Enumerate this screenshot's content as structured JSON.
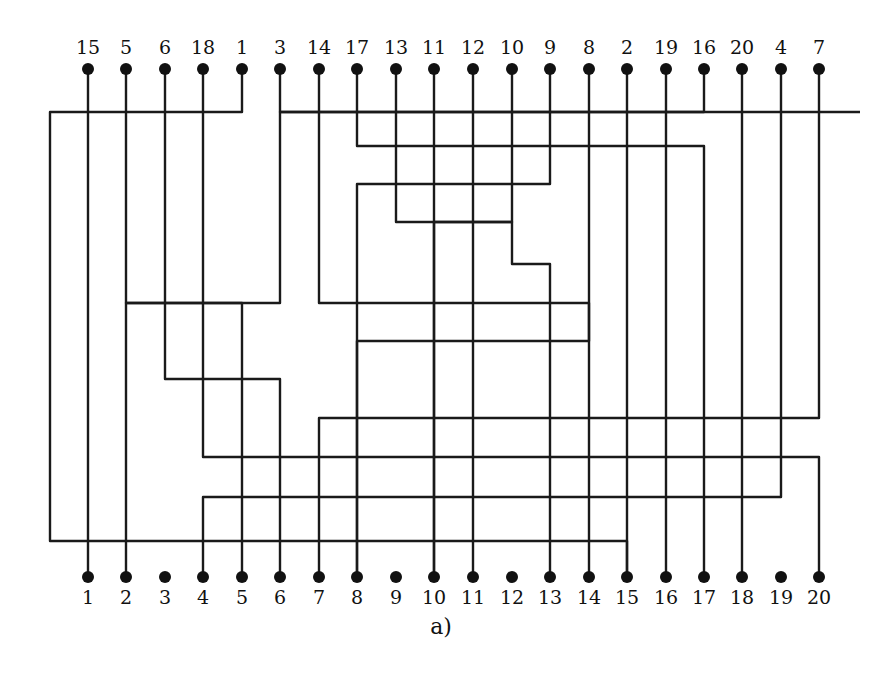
{
  "diagram": {
    "caption": "a)",
    "line_color": "#1a1a1a",
    "pin_color": "#111111",
    "columns_x": [
      88,
      126,
      165,
      203,
      242,
      280,
      319,
      357,
      396,
      434,
      473,
      512,
      550,
      589,
      627,
      666,
      704,
      742,
      781,
      819
    ],
    "top_pin_y": 69,
    "bottom_pin_y": 577,
    "top_labels": [
      "15",
      "5",
      "6",
      "18",
      "1",
      "3",
      "14",
      "17",
      "13",
      "11",
      "12",
      "10",
      "9",
      "8",
      "2",
      "19",
      "16",
      "20",
      "4",
      "7"
    ],
    "bottom_labels": [
      "1",
      "2",
      "3",
      "4",
      "5",
      "6",
      "7",
      "8",
      "9",
      "10",
      "11",
      "12",
      "13",
      "14",
      "15",
      "16",
      "17",
      "18",
      "19",
      "20"
    ],
    "wires": [
      {
        "label": "15",
        "path": [
          [
            88,
            69
          ],
          [
            88,
            541
          ],
          [
            627,
            541
          ],
          [
            627,
            577
          ]
        ]
      },
      {
        "label": "5",
        "path": [
          [
            126,
            69
          ],
          [
            126,
            303
          ],
          [
            242,
            303
          ],
          [
            242,
            577
          ]
        ]
      },
      {
        "label": "6",
        "path": [
          [
            165,
            69
          ],
          [
            165,
            379
          ],
          [
            280,
            379
          ],
          [
            280,
            577
          ]
        ]
      },
      {
        "label": "18",
        "path": [
          [
            203,
            69
          ],
          [
            203,
            457
          ],
          [
            742,
            457
          ],
          [
            742,
            577
          ]
        ]
      },
      {
        "label": "1",
        "path": [
          [
            242,
            69
          ],
          [
            242,
            112
          ],
          [
            50,
            112
          ],
          [
            50,
            541
          ],
          [
            88,
            541
          ],
          [
            88,
            577
          ]
        ]
      },
      {
        "label": "3",
        "path": [
          [
            280,
            69
          ],
          [
            280,
            112
          ],
          [
            860,
            112
          ],
          [
            860,
            112
          ]
        ],
        "alt": [
          [
            280,
            112
          ],
          [
            280,
            379
          ],
          [
            165,
            379
          ],
          [
            165,
            577
          ]
        ]
      },
      {
        "label": "14",
        "path": [
          [
            319,
            69
          ],
          [
            319,
            303
          ],
          [
            589,
            303
          ],
          [
            589,
            577
          ]
        ]
      },
      {
        "label": "17",
        "path": [
          [
            357,
            69
          ],
          [
            357,
            146
          ],
          [
            704,
            146
          ],
          [
            704,
            577
          ]
        ]
      },
      {
        "label": "13",
        "path": [
          [
            396,
            69
          ],
          [
            396,
            222
          ],
          [
            512,
            222
          ],
          [
            512,
            264
          ],
          [
            550,
            264
          ],
          [
            550,
            577
          ]
        ]
      },
      {
        "label": "11",
        "path": [
          [
            434,
            69
          ],
          [
            434,
            577
          ]
        ]
      },
      {
        "label": "12",
        "path": [
          [
            473,
            69
          ],
          [
            473,
            577
          ]
        ]
      },
      {
        "label": "10",
        "path": [
          [
            512,
            69
          ],
          [
            512,
            222
          ],
          [
            434,
            222
          ],
          [
            434,
            577
          ]
        ]
      },
      {
        "label": "9",
        "path": [
          [
            550,
            69
          ],
          [
            550,
            184
          ],
          [
            357,
            184
          ],
          [
            357,
            577
          ]
        ]
      },
      {
        "label": "8",
        "path": [
          [
            589,
            69
          ],
          [
            589,
            341
          ],
          [
            357,
            341
          ],
          [
            357,
            577
          ]
        ]
      },
      {
        "label": "2",
        "path": [
          [
            627,
            69
          ],
          [
            627,
            112
          ],
          [
            280,
            112
          ],
          [
            280,
            303
          ],
          [
            126,
            303
          ],
          [
            126,
            577
          ]
        ]
      },
      {
        "label": "19",
        "path": [
          [
            666,
            69
          ],
          [
            666,
            577
          ]
        ]
      },
      {
        "label": "16",
        "path": [
          [
            704,
            69
          ],
          [
            704,
            112
          ],
          [
            627,
            112
          ],
          [
            627,
            577
          ]
        ]
      },
      {
        "label": "20",
        "path": [
          [
            742,
            69
          ],
          [
            742,
            457
          ],
          [
            819,
            457
          ],
          [
            819,
            577
          ]
        ]
      },
      {
        "label": "4",
        "path": [
          [
            781,
            69
          ],
          [
            781,
            497
          ],
          [
            203,
            497
          ],
          [
            203,
            577
          ]
        ]
      },
      {
        "label": "7",
        "path": [
          [
            819,
            69
          ],
          [
            819,
            418
          ],
          [
            319,
            418
          ],
          [
            319,
            577
          ]
        ]
      }
    ],
    "segments": [
      [
        [
          88,
          80
        ],
        [
          88,
          541
        ]
      ],
      [
        [
          88,
          541
        ],
        [
          620,
          541
        ]
      ],
      [
        [
          627,
          547
        ],
        [
          627,
          577
        ]
      ],
      [
        [
          50,
          112
        ],
        [
          236,
          112
        ]
      ],
      [
        [
          248,
          112
        ],
        [
          860,
          112
        ]
      ],
      [
        [
          50,
          112
        ],
        [
          50,
          541
        ]
      ],
      [
        [
          50,
          541
        ],
        [
          82,
          541
        ]
      ],
      [
        [
          94,
          541
        ],
        [
          100,
          541
        ]
      ],
      [
        [
          88,
          547
        ],
        [
          88,
          577
        ]
      ],
      [
        [
          126,
          80
        ],
        [
          126,
          303
        ]
      ],
      [
        [
          126,
          303
        ],
        [
          242,
          303
        ]
      ],
      [
        [
          242,
          303
        ],
        [
          242,
          577
        ]
      ],
      [
        [
          165,
          80
        ],
        [
          165,
          379
        ]
      ],
      [
        [
          165,
          379
        ],
        [
          280,
          379
        ]
      ],
      [
        [
          280,
          379
        ],
        [
          280,
          577
        ]
      ],
      [
        [
          203,
          80
        ],
        [
          203,
          457
        ]
      ],
      [
        [
          203,
          457
        ],
        [
          742,
          457
        ]
      ],
      [
        [
          242,
          80
        ],
        [
          242,
          112
        ]
      ],
      [
        [
          242,
          112
        ],
        [
          242,
          303
        ]
      ],
      [
        [
          280,
          80
        ],
        [
          280,
          303
        ]
      ],
      [
        [
          280,
          303
        ],
        [
          319,
          303
        ]
      ],
      [
        [
          319,
          80
        ],
        [
          319,
          303
        ]
      ],
      [
        [
          319,
          303
        ],
        [
          589,
          303
        ]
      ],
      [
        [
          589,
          303
        ],
        [
          589,
          577
        ]
      ],
      [
        [
          357,
          80
        ],
        [
          357,
          146
        ]
      ],
      [
        [
          357,
          146
        ],
        [
          704,
          146
        ]
      ],
      [
        [
          704,
          146
        ],
        [
          704,
          577
        ]
      ],
      [
        [
          396,
          80
        ],
        [
          396,
          222
        ]
      ],
      [
        [
          396,
          222
        ],
        [
          512,
          222
        ]
      ],
      [
        [
          512,
          222
        ],
        [
          512,
          577
        ]
      ],
      [
        [
          434,
          80
        ],
        [
          434,
          577
        ]
      ],
      [
        [
          473,
          80
        ],
        [
          473,
          577
        ]
      ],
      [
        [
          512,
          80
        ],
        [
          512,
          222
        ]
      ],
      [
        [
          550,
          80
        ],
        [
          550,
          184
        ]
      ],
      [
        [
          550,
          184
        ],
        [
          357,
          184
        ]
      ],
      [
        [
          357,
          184
        ],
        [
          357,
          577
        ]
      ],
      [
        [
          589,
          80
        ],
        [
          589,
          341
        ]
      ],
      [
        [
          589,
          341
        ],
        [
          126,
          341
        ]
      ],
      [
        [
          126,
          341
        ],
        [
          126,
          577
        ]
      ],
      [
        [
          627,
          80
        ],
        [
          627,
          112
        ]
      ],
      [
        [
          627,
          112
        ],
        [
          627,
          541
        ]
      ],
      [
        [
          666,
          80
        ],
        [
          666,
          577
        ]
      ],
      [
        [
          704,
          80
        ],
        [
          704,
          112
        ]
      ],
      [
        [
          742,
          80
        ],
        [
          742,
          457
        ]
      ],
      [
        [
          742,
          457
        ],
        [
          742,
          577
        ]
      ],
      [
        [
          781,
          80
        ],
        [
          781,
          497
        ]
      ],
      [
        [
          781,
          497
        ],
        [
          203,
          497
        ]
      ],
      [
        [
          203,
          497
        ],
        [
          203,
          577
        ]
      ],
      [
        [
          819,
          80
        ],
        [
          819,
          418
        ]
      ],
      [
        [
          819,
          418
        ],
        [
          165,
          418
        ]
      ],
      [
        [
          165,
          418
        ],
        [
          165,
          577
        ]
      ],
      [
        [
          280,
          264
        ],
        [
          550,
          264
        ]
      ],
      [
        [
          396,
          264
        ],
        [
          396,
          577
        ]
      ],
      [
        [
          473,
          264
        ],
        [
          473,
          577
        ]
      ],
      [
        [
          550,
          264
        ],
        [
          550,
          577
        ]
      ],
      [
        [
          165,
          379
        ],
        [
          165,
          418
        ]
      ],
      [
        [
          203,
          457
        ],
        [
          203,
          497
        ]
      ],
      [
        [
          819,
          457
        ],
        [
          819,
          577
        ]
      ],
      [
        [
          742,
          457
        ],
        [
          742,
          497
        ]
      ],
      [
        [
          319,
          418
        ],
        [
          319,
          577
        ]
      ],
      [
        [
          280,
          379
        ],
        [
          627,
          379
        ]
      ],
      [
        [
          627,
          379
        ],
        [
          627,
          541
        ]
      ],
      [
        [
          666,
          457
        ],
        [
          666,
          541
        ]
      ]
    ],
    "background_text_lines": [
      {
        "x": 640,
        "y": 80,
        "text": "…at a quiet … can…"
      },
      {
        "x": 700,
        "y": 200,
        "text": "…ing …"
      },
      {
        "x": 680,
        "y": 330,
        "text": "…on …"
      }
    ]
  }
}
